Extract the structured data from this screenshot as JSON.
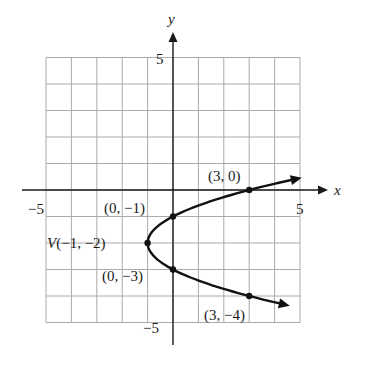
{
  "chart_data": {
    "type": "line",
    "title": "",
    "xlabel": "x",
    "ylabel": "y",
    "xlim": [
      -5,
      5
    ],
    "ylim": [
      -5,
      5
    ],
    "grid": true,
    "x_tick_labels": [
      "-5",
      "5"
    ],
    "y_tick_labels": [
      "5",
      "-5"
    ],
    "curve": {
      "name": "parabola",
      "equation": "x = (y + 2)^2 - 1",
      "opens": "right",
      "vertex": [
        -1,
        -2
      ],
      "y_range": [
        -4.3,
        0.4
      ]
    },
    "points": [
      {
        "x": 3,
        "y": 0,
        "label": "(3, 0)"
      },
      {
        "x": 0,
        "y": -1,
        "label": "(0, −1)"
      },
      {
        "x": -1,
        "y": -2,
        "label": "V(−1, −2)"
      },
      {
        "x": 0,
        "y": -3,
        "label": "(0, −3)"
      },
      {
        "x": 3,
        "y": -4,
        "label": "(3, −4)"
      }
    ]
  },
  "axes": {
    "x_label": "x",
    "y_label": "y",
    "x_min_label": "−5",
    "x_max_label": "5",
    "y_max_label": "5",
    "y_min_label": "−5"
  },
  "labels": {
    "p30": "(3, 0)",
    "p0m1": "(0, −1)",
    "vertex_prefix": "V",
    "vertex": "(−1, −2)",
    "p0m3": "(0, −3)",
    "p3m4": "(3, −4)"
  },
  "colors": {
    "grid": "#aaaaaa",
    "axis": "#1a1a1a",
    "curve": "#111111"
  }
}
